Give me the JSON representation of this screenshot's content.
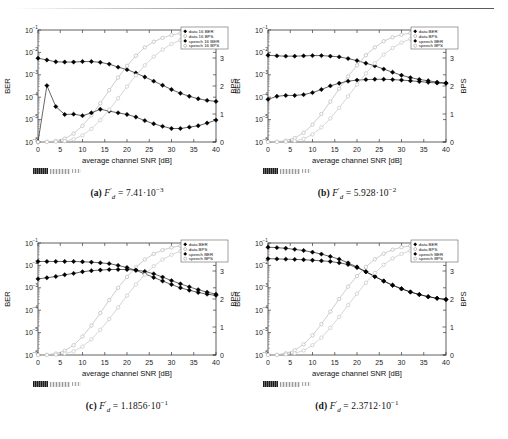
{
  "figure": {
    "panels": [
      {
        "id": "a",
        "caption_label": "(a)",
        "caption_math_var": "F",
        "caption_math_prime": "′",
        "caption_math_sub": "d",
        "caption_eq": "=",
        "caption_mantissa": "7.41",
        "caption_dot": "·",
        "caption_base": "10",
        "caption_exp": "−3",
        "legend": [
          "data 16 BER",
          "data 16 BPS",
          "speech 16 BER",
          "speech 16 BPS"
        ]
      },
      {
        "id": "b",
        "caption_label": "(b)",
        "caption_math_var": "F",
        "caption_math_prime": "′",
        "caption_math_sub": "d",
        "caption_eq": "=",
        "caption_mantissa": "5.928",
        "caption_dot": "·",
        "caption_base": "10",
        "caption_exp": "−2",
        "legend": [
          "data BER",
          "data BPS",
          "speech BER",
          "speech BPS"
        ]
      },
      {
        "id": "c",
        "caption_label": "(c)",
        "caption_math_var": "F",
        "caption_math_prime": "′",
        "caption_math_sub": "d",
        "caption_eq": "=",
        "caption_mantissa": "1.1856",
        "caption_dot": "·",
        "caption_base": "10",
        "caption_exp": "−1",
        "legend": [
          "data BER",
          "data BPS",
          "speech BER",
          "speech BPS"
        ]
      },
      {
        "id": "d",
        "caption_label": "(d)",
        "caption_math_var": "F",
        "caption_math_prime": "′",
        "caption_math_sub": "d",
        "caption_eq": "=",
        "caption_mantissa": "2.3712",
        "caption_dot": "·",
        "caption_base": "10",
        "caption_exp": "−1",
        "legend": [
          "data BER",
          "data BPS",
          "speech BER",
          "speech BPS"
        ]
      }
    ]
  },
  "chart_data": [
    {
      "type": "line",
      "panel": "a",
      "title": "",
      "xlabel": "average channel SNR [dB]",
      "ylabel": "BER",
      "ylabel_right": "BPS",
      "xlim": [
        0,
        40
      ],
      "xticks": [
        0,
        5,
        10,
        15,
        20,
        25,
        30,
        35,
        40
      ],
      "ylim_log": [
        1e-06,
        0.1
      ],
      "yticks": [
        "10-1",
        "10-2",
        "10-3",
        "10-4",
        "10-5",
        "10-6"
      ],
      "ylim_right": [
        0,
        4
      ],
      "yticks_right": [
        0,
        1,
        2,
        3,
        4
      ],
      "grid": false,
      "legend_position": "top-right",
      "series": [
        {
          "name": "data 16 BER",
          "axis": "left",
          "marker": "filled-diamond",
          "color": "#000000",
          "x": [
            0,
            2,
            4,
            6,
            8,
            10,
            12,
            14,
            16,
            18,
            20,
            22,
            24,
            26,
            28,
            30,
            32,
            34,
            36,
            38,
            40
          ],
          "y": [
            0.0055,
            0.0046,
            0.0038,
            0.0037,
            0.0037,
            0.0039,
            0.0039,
            0.0036,
            0.003,
            0.0022,
            0.0017,
            0.0012,
            0.0008,
            0.00052,
            0.00034,
            0.00022,
            0.00015,
            0.00011,
            8.5e-05,
            7.2e-05,
            6.5e-05
          ]
        },
        {
          "name": "data 16 BPS",
          "axis": "right",
          "marker": "open-circle",
          "color": "#b9b9b9",
          "x": [
            0,
            2,
            4,
            6,
            8,
            10,
            12,
            14,
            16,
            18,
            20,
            22,
            24,
            26,
            28,
            30,
            32,
            34,
            36,
            38,
            40
          ],
          "y": [
            0.0,
            0.01,
            0.04,
            0.12,
            0.3,
            0.58,
            0.95,
            1.38,
            1.85,
            2.3,
            2.72,
            3.08,
            3.38,
            3.58,
            3.72,
            3.82,
            3.88,
            3.92,
            3.95,
            3.97,
            3.98
          ]
        },
        {
          "name": "speech 16 BER",
          "axis": "left",
          "marker": "filled-diamond",
          "color": "#000000",
          "x": [
            0,
            2,
            4,
            6,
            8,
            10,
            12,
            14,
            16,
            18,
            20,
            22,
            24,
            26,
            28,
            30,
            32,
            34,
            36,
            38,
            40
          ],
          "y": [
            1e-06,
            0.00033,
            3.8e-05,
            1.7e-05,
            1.75e-05,
            1.5e-05,
            2e-05,
            2.9e-05,
            2.4e-05,
            2e-05,
            1.7e-05,
            1.3e-05,
            9e-06,
            6.5e-06,
            5e-06,
            4e-06,
            4e-06,
            4.6e-06,
            5.3e-06,
            7e-06,
            9.5e-06
          ]
        },
        {
          "name": "speech 16 BPS",
          "axis": "right",
          "marker": "open-circle",
          "color": "#c6c6c6",
          "x": [
            0,
            2,
            4,
            6,
            8,
            10,
            12,
            14,
            16,
            18,
            20,
            22,
            24,
            26,
            28,
            30,
            32,
            34,
            36,
            38,
            40
          ],
          "y": [
            0.0,
            0.0,
            0.01,
            0.03,
            0.1,
            0.24,
            0.47,
            0.78,
            1.15,
            1.56,
            1.98,
            2.38,
            2.74,
            3.05,
            3.3,
            3.5,
            3.64,
            3.75,
            3.82,
            3.88,
            3.92
          ]
        }
      ]
    },
    {
      "type": "line",
      "panel": "b",
      "title": "",
      "xlabel": "average channel SNR [dB]",
      "ylabel": "BER",
      "ylabel_right": "BPS",
      "xlim": [
        0,
        40
      ],
      "xticks": [
        0,
        5,
        10,
        15,
        20,
        25,
        30,
        35,
        40
      ],
      "ylim_log": [
        1e-06,
        0.1
      ],
      "yticks": [
        "10-1",
        "10-2",
        "10-3",
        "10-4",
        "10-5",
        "10-6"
      ],
      "ylim_right": [
        0,
        4
      ],
      "yticks_right": [
        0,
        1,
        2,
        3,
        4
      ],
      "grid": false,
      "legend_position": "top-right",
      "series": [
        {
          "name": "data BER",
          "axis": "left",
          "marker": "filled-diamond",
          "color": "#000000",
          "x": [
            0,
            2,
            4,
            6,
            8,
            10,
            12,
            14,
            16,
            18,
            20,
            22,
            24,
            26,
            28,
            30,
            32,
            34,
            36,
            38,
            40
          ],
          "y": [
            0.0075,
            0.007,
            0.0068,
            0.0068,
            0.007,
            0.0072,
            0.0072,
            0.0068,
            0.0063,
            0.0053,
            0.0043,
            0.0033,
            0.0025,
            0.0018,
            0.0013,
            0.00095,
            0.00075,
            0.00062,
            0.00054,
            0.00047,
            0.00043
          ]
        },
        {
          "name": "data BPS",
          "axis": "right",
          "marker": "open-circle",
          "color": "#b9b9b9",
          "x": [
            0,
            2,
            4,
            6,
            8,
            10,
            12,
            14,
            16,
            18,
            20,
            22,
            24,
            26,
            28,
            30,
            32,
            34,
            36,
            38,
            40
          ],
          "y": [
            0.0,
            0.01,
            0.05,
            0.14,
            0.33,
            0.62,
            1.0,
            1.44,
            1.9,
            2.34,
            2.74,
            3.1,
            3.38,
            3.6,
            3.74,
            3.83,
            3.89,
            3.93,
            3.95,
            3.97,
            3.98
          ]
        },
        {
          "name": "speech BER",
          "axis": "left",
          "marker": "filled-diamond",
          "color": "#000000",
          "x": [
            0,
            2,
            4,
            6,
            8,
            10,
            12,
            14,
            16,
            18,
            20,
            22,
            24,
            26,
            28,
            30,
            32,
            34,
            36,
            38,
            40
          ],
          "y": [
            8e-05,
            0.00011,
            0.00012,
            0.00012,
            0.00013,
            0.00016,
            0.00022,
            0.00032,
            0.00042,
            0.00052,
            0.00058,
            0.00061,
            0.00063,
            0.00063,
            0.00061,
            0.00058,
            0.00054,
            0.0005,
            0.00046,
            0.00043,
            0.00042
          ]
        },
        {
          "name": "speech BPS",
          "axis": "right",
          "marker": "open-circle",
          "color": "#c6c6c6",
          "x": [
            0,
            2,
            4,
            6,
            8,
            10,
            12,
            14,
            16,
            18,
            20,
            22,
            24,
            26,
            28,
            30,
            32,
            34,
            36,
            38,
            40
          ],
          "y": [
            0.0,
            0.0,
            0.01,
            0.04,
            0.11,
            0.27,
            0.52,
            0.84,
            1.22,
            1.63,
            2.05,
            2.45,
            2.81,
            3.12,
            3.36,
            3.55,
            3.68,
            3.78,
            3.85,
            3.9,
            3.93
          ]
        }
      ]
    },
    {
      "type": "line",
      "panel": "c",
      "title": "",
      "xlabel": "average channel SNR [dB]",
      "ylabel": "BER",
      "ylabel_right": "BPS",
      "xlim": [
        0,
        40
      ],
      "xticks": [
        0,
        5,
        10,
        15,
        20,
        25,
        30,
        35,
        40
      ],
      "ylim_log": [
        1e-06,
        0.1
      ],
      "yticks": [
        "10-1",
        "10-2",
        "10-3",
        "10-4",
        "10-5",
        "10-6"
      ],
      "ylim_right": [
        0,
        4
      ],
      "yticks_right": [
        0,
        1,
        2,
        3,
        4
      ],
      "grid": false,
      "legend_position": "top-right",
      "series": [
        {
          "name": "data BER",
          "axis": "left",
          "marker": "filled-diamond",
          "color": "#000000",
          "x": [
            0,
            2,
            4,
            6,
            8,
            10,
            12,
            14,
            16,
            18,
            20,
            22,
            24,
            26,
            28,
            30,
            32,
            34,
            36,
            38,
            40
          ],
          "y": [
            0.015,
            0.015,
            0.015,
            0.015,
            0.015,
            0.0145,
            0.014,
            0.013,
            0.012,
            0.01,
            0.008,
            0.006,
            0.0042,
            0.0029,
            0.002,
            0.0014,
            0.001,
            0.00078,
            0.00062,
            0.00052,
            0.00046
          ]
        },
        {
          "name": "data BPS",
          "axis": "right",
          "marker": "open-circle",
          "color": "#b9b9b9",
          "x": [
            0,
            2,
            4,
            6,
            8,
            10,
            12,
            14,
            16,
            18,
            20,
            22,
            24,
            26,
            28,
            30,
            32,
            34,
            36,
            38,
            40
          ],
          "y": [
            0.0,
            0.01,
            0.05,
            0.15,
            0.35,
            0.66,
            1.05,
            1.5,
            1.96,
            2.4,
            2.79,
            3.13,
            3.41,
            3.61,
            3.75,
            3.84,
            3.9,
            3.93,
            3.96,
            3.97,
            3.98
          ]
        },
        {
          "name": "speech BER",
          "axis": "left",
          "marker": "filled-diamond",
          "color": "#000000",
          "x": [
            0,
            2,
            4,
            6,
            8,
            10,
            12,
            14,
            16,
            18,
            20,
            22,
            24,
            26,
            28,
            30,
            32,
            34,
            36,
            38,
            40
          ],
          "y": [
            0.0025,
            0.0028,
            0.0032,
            0.0038,
            0.0044,
            0.0052,
            0.0058,
            0.0062,
            0.0065,
            0.0066,
            0.0065,
            0.0062,
            0.0054,
            0.0042,
            0.003,
            0.0021,
            0.0015,
            0.0011,
            0.00082,
            0.00064,
            0.00052
          ]
        },
        {
          "name": "speech BPS",
          "axis": "right",
          "marker": "open-circle",
          "color": "#c6c6c6",
          "x": [
            0,
            2,
            4,
            6,
            8,
            10,
            12,
            14,
            16,
            18,
            20,
            22,
            24,
            26,
            28,
            30,
            32,
            34,
            36,
            38,
            40
          ],
          "y": [
            0.0,
            0.0,
            0.01,
            0.05,
            0.13,
            0.3,
            0.56,
            0.9,
            1.28,
            1.7,
            2.12,
            2.52,
            2.87,
            3.17,
            3.41,
            3.58,
            3.71,
            3.8,
            3.86,
            3.91,
            3.94
          ]
        }
      ]
    },
    {
      "type": "line",
      "panel": "d",
      "title": "",
      "xlabel": "average channel SNR [dB]",
      "ylabel": "BER",
      "ylabel_right": "BPS",
      "xlim": [
        0,
        40
      ],
      "xticks": [
        0,
        5,
        10,
        15,
        20,
        25,
        30,
        35,
        40
      ],
      "ylim_log": [
        1e-06,
        0.1
      ],
      "yticks": [
        "10-1",
        "10-2",
        "10-3",
        "10-4",
        "10-5",
        "10-6"
      ],
      "ylim_right": [
        0,
        4
      ],
      "yticks_right": [
        0,
        1,
        2,
        3,
        4
      ],
      "grid": false,
      "legend_position": "top-right",
      "series": [
        {
          "name": "data BER",
          "axis": "left",
          "marker": "filled-diamond",
          "color": "#000000",
          "x": [
            0,
            2,
            4,
            6,
            8,
            10,
            12,
            14,
            16,
            18,
            20,
            22,
            24,
            26,
            28,
            30,
            32,
            34,
            36,
            38,
            40
          ],
          "y": [
            0.065,
            0.062,
            0.058,
            0.052,
            0.046,
            0.039,
            0.032,
            0.025,
            0.019,
            0.013,
            0.0085,
            0.0052,
            0.0032,
            0.002,
            0.0013,
            0.0009,
            0.00065,
            0.0005,
            0.0004,
            0.00034,
            0.0003
          ]
        },
        {
          "name": "data BPS",
          "axis": "right",
          "marker": "open-circle",
          "color": "#b9b9b9",
          "x": [
            0,
            2,
            4,
            6,
            8,
            10,
            12,
            14,
            16,
            18,
            20,
            22,
            24,
            26,
            28,
            30,
            32,
            34,
            36,
            38,
            40
          ],
          "y": [
            0.0,
            0.01,
            0.06,
            0.17,
            0.38,
            0.7,
            1.1,
            1.55,
            2.0,
            2.44,
            2.82,
            3.15,
            3.42,
            3.62,
            3.76,
            3.85,
            3.9,
            3.94,
            3.96,
            3.97,
            3.98
          ]
        },
        {
          "name": "speech BER",
          "axis": "left",
          "marker": "filled-diamond",
          "color": "#000000",
          "x": [
            0,
            2,
            4,
            6,
            8,
            10,
            12,
            14,
            16,
            18,
            20,
            22,
            24,
            26,
            28,
            30,
            32,
            34,
            36,
            38,
            40
          ],
          "y": [
            0.02,
            0.0195,
            0.019,
            0.0185,
            0.018,
            0.017,
            0.016,
            0.015,
            0.013,
            0.011,
            0.008,
            0.0052,
            0.0032,
            0.002,
            0.0013,
            0.0009,
            0.00065,
            0.0005,
            0.0004,
            0.00034,
            0.0003
          ]
        },
        {
          "name": "speech BPS",
          "axis": "right",
          "marker": "open-circle",
          "color": "#c6c6c6",
          "x": [
            0,
            2,
            4,
            6,
            8,
            10,
            12,
            14,
            16,
            18,
            20,
            22,
            24,
            26,
            28,
            30,
            32,
            34,
            36,
            38,
            40
          ],
          "y": [
            0.0,
            0.0,
            0.02,
            0.06,
            0.16,
            0.35,
            0.62,
            0.97,
            1.36,
            1.78,
            2.19,
            2.58,
            2.93,
            3.22,
            3.45,
            3.61,
            3.73,
            3.81,
            3.87,
            3.92,
            3.94
          ]
        }
      ]
    }
  ]
}
